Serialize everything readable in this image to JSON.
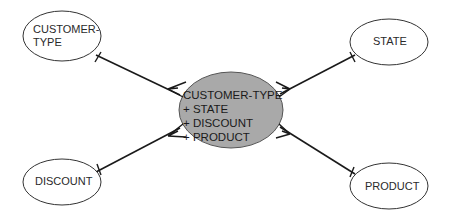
{
  "diagram": {
    "type": "entity-relationship",
    "center_entity": {
      "lines": [
        "CUSTOMER-TYPE",
        "+ STATE",
        "+ DISCOUNT",
        "+ PRODUCT"
      ],
      "fill": "#a9a9a9"
    },
    "entities": [
      {
        "id": "customer-type",
        "lines": [
          "CUSTOMER-",
          "TYPE"
        ]
      },
      {
        "id": "state",
        "lines": [
          "STATE"
        ]
      },
      {
        "id": "discount",
        "lines": [
          "DISCOUNT"
        ]
      },
      {
        "id": "product",
        "lines": [
          "PRODUCT"
        ]
      }
    ],
    "relationships": [
      {
        "from": "customer-type",
        "to": "center",
        "from_end": "one",
        "to_end": "many"
      },
      {
        "from": "state",
        "to": "center",
        "from_end": "one",
        "to_end": "many"
      },
      {
        "from": "discount",
        "to": "center",
        "from_end": "one",
        "to_end": "many"
      },
      {
        "from": "product",
        "to": "center",
        "from_end": "one",
        "to_end": "many"
      }
    ]
  }
}
